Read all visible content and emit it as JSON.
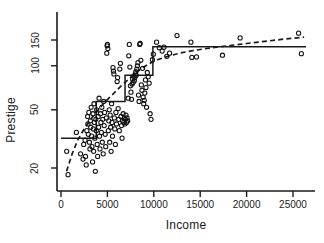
{
  "chart_data": {
    "type": "scatter",
    "title": "",
    "xlabel": "Income",
    "ylabel": "Prestige",
    "xlim": [
      0,
      26400
    ],
    "ylim": [
      16,
      175
    ],
    "yscale": "log",
    "xscale": "linear",
    "grid": false,
    "legend": null,
    "xticks": [
      0,
      5000,
      10000,
      15000,
      20000,
      25000
    ],
    "xticklabels": [
      "0",
      "5000",
      "10000",
      "15000",
      "20000",
      "25000"
    ],
    "yticks": [
      20,
      50,
      100,
      150
    ],
    "yticklabels": [
      "20",
      "50",
      "100",
      "150"
    ],
    "marker": "open-circle",
    "points": [
      [
        611,
        26
      ],
      [
        761,
        18
      ],
      [
        1656,
        35
      ],
      [
        2110,
        25
      ],
      [
        2370,
        23
      ],
      [
        2448,
        29
      ],
      [
        2594,
        31
      ],
      [
        2642,
        24
      ],
      [
        2716,
        21
      ],
      [
        2787,
        36
      ],
      [
        2866,
        45
      ],
      [
        2899,
        40
      ],
      [
        2941,
        34
      ],
      [
        3000,
        48
      ],
      [
        3060,
        30
      ],
      [
        3116,
        27
      ],
      [
        3161,
        42
      ],
      [
        3200,
        38
      ],
      [
        3248,
        52
      ],
      [
        3300,
        33
      ],
      [
        3345,
        28
      ],
      [
        3400,
        22
      ],
      [
        3446,
        47
      ],
      [
        3487,
        37
      ],
      [
        3521,
        26
      ],
      [
        3554,
        55
      ],
      [
        3600,
        41
      ],
      [
        3647,
        32
      ],
      [
        3700,
        19
      ],
      [
        3750,
        43
      ],
      [
        3800,
        36
      ],
      [
        3842,
        50
      ],
      [
        3900,
        29
      ],
      [
        3950,
        24
      ],
      [
        4000,
        45
      ],
      [
        4055,
        38
      ],
      [
        4100,
        60
      ],
      [
        4150,
        33
      ],
      [
        4200,
        27
      ],
      [
        4250,
        47
      ],
      [
        4300,
        41
      ],
      [
        4350,
        35
      ],
      [
        4400,
        52
      ],
      [
        4450,
        30
      ],
      [
        4500,
        43
      ],
      [
        4550,
        25
      ],
      [
        4600,
        57
      ],
      [
        4650,
        39
      ],
      [
        4700,
        48
      ],
      [
        4760,
        34
      ],
      [
        4820,
        28
      ],
      [
        4880,
        44
      ],
      [
        4930,
        122
      ],
      [
        4970,
        137
      ],
      [
        5000,
        140
      ],
      [
        5050,
        131
      ],
      [
        5100,
        36
      ],
      [
        5150,
        42
      ],
      [
        5200,
        50
      ],
      [
        5250,
        30
      ],
      [
        5300,
        46
      ],
      [
        5350,
        38
      ],
      [
        5400,
        26
      ],
      [
        5450,
        55
      ],
      [
        5500,
        41
      ],
      [
        5550,
        33
      ],
      [
        5600,
        97
      ],
      [
        5650,
        92
      ],
      [
        5700,
        88
      ],
      [
        5750,
        44
      ],
      [
        5800,
        37
      ],
      [
        5860,
        29
      ],
      [
        5920,
        48
      ],
      [
        5980,
        40
      ],
      [
        6050,
        78
      ],
      [
        6100,
        83
      ],
      [
        6160,
        51
      ],
      [
        6220,
        43
      ],
      [
        6280,
        36
      ],
      [
        6340,
        95
      ],
      [
        6400,
        104
      ],
      [
        6460,
        45
      ],
      [
        6520,
        39
      ],
      [
        6580,
        32
      ],
      [
        6640,
        42
      ],
      [
        6700,
        47
      ],
      [
        6760,
        41
      ],
      [
        6820,
        44
      ],
      [
        6880,
        40
      ],
      [
        6940,
        43
      ],
      [
        7000,
        46
      ],
      [
        7060,
        41
      ],
      [
        7120,
        44
      ],
      [
        7180,
        42
      ],
      [
        7240,
        60
      ],
      [
        7300,
        117
      ],
      [
        7360,
        140
      ],
      [
        7420,
        98
      ],
      [
        7480,
        73
      ],
      [
        7540,
        66
      ],
      [
        7600,
        59
      ],
      [
        7660,
        75
      ],
      [
        7720,
        81
      ],
      [
        7780,
        77
      ],
      [
        7840,
        85
      ],
      [
        7900,
        79
      ],
      [
        7960,
        83
      ],
      [
        8010,
        88
      ],
      [
        8060,
        91
      ],
      [
        8110,
        86
      ],
      [
        8170,
        95
      ],
      [
        8230,
        100
      ],
      [
        8290,
        105
      ],
      [
        8350,
        63
      ],
      [
        8410,
        57
      ],
      [
        8470,
        140
      ],
      [
        8530,
        142
      ],
      [
        8600,
        109
      ],
      [
        8660,
        74
      ],
      [
        8720,
        68
      ],
      [
        8790,
        96
      ],
      [
        8850,
        61
      ],
      [
        8910,
        55
      ],
      [
        8970,
        58
      ],
      [
        9030,
        65
      ],
      [
        9100,
        80
      ],
      [
        9160,
        71
      ],
      [
        9220,
        52
      ],
      [
        9300,
        90
      ],
      [
        9400,
        84
      ],
      [
        9500,
        76
      ],
      [
        9600,
        47
      ],
      [
        9700,
        43
      ],
      [
        9850,
        110
      ],
      [
        9950,
        120
      ],
      [
        10300,
        145
      ],
      [
        10600,
        133
      ],
      [
        10900,
        126
      ],
      [
        11100,
        134
      ],
      [
        11400,
        116
      ],
      [
        11700,
        122
      ],
      [
        12500,
        161
      ],
      [
        14000,
        145
      ],
      [
        14100,
        114
      ],
      [
        14600,
        115
      ],
      [
        17400,
        118
      ],
      [
        19300,
        155
      ],
      [
        25600,
        167
      ],
      [
        25900,
        121
      ]
    ],
    "step_fit": {
      "label": "step-function fit",
      "style": "solid",
      "breaks": [
        0,
        3800,
        6900,
        9900,
        26400
      ],
      "levels": [
        32,
        57,
        86,
        135
      ]
    },
    "smooth_fit": {
      "label": "logarithmic smooth fit",
      "style": "dashed",
      "curve": [
        [
          600,
          19
        ],
        [
          1200,
          25
        ],
        [
          1800,
          31
        ],
        [
          2500,
          37
        ],
        [
          3200,
          43
        ],
        [
          4000,
          50
        ],
        [
          4800,
          57
        ],
        [
          5600,
          64
        ],
        [
          6400,
          72
        ],
        [
          7200,
          80
        ],
        [
          8000,
          89
        ],
        [
          8800,
          97
        ],
        [
          9600,
          104
        ],
        [
          10400,
          110
        ],
        [
          11500,
          116
        ],
        [
          12800,
          122
        ],
        [
          14200,
          127
        ],
        [
          16000,
          132
        ],
        [
          18000,
          137
        ],
        [
          20000,
          142
        ],
        [
          22000,
          147
        ],
        [
          24000,
          152
        ],
        [
          26200,
          157
        ]
      ]
    }
  },
  "axes": {
    "ylabel": "Prestige",
    "xlabel": "Income"
  }
}
